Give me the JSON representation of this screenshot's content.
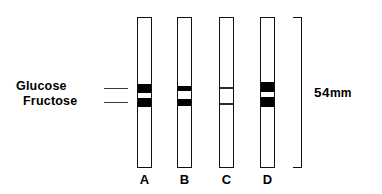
{
  "figure": {
    "type": "chromatography-strip-diagram",
    "analyte_labels": [
      {
        "name": "glucose",
        "text": "Glucose"
      },
      {
        "name": "fructose",
        "text": "Fructose"
      }
    ],
    "leaders": [
      {
        "name": "glucose-leader",
        "x": 104,
        "y": 88,
        "length": 24
      },
      {
        "name": "fructose-leader",
        "x": 104,
        "y": 102,
        "length": 24
      }
    ],
    "strips": [
      {
        "id": "A",
        "caption": "A",
        "x": 137,
        "bands": [
          {
            "analyte": "Glucose",
            "top": 66,
            "height": 9,
            "intensity": "strong"
          },
          {
            "analyte": "Fructose",
            "top": 80,
            "height": 9,
            "intensity": "strong"
          }
        ]
      },
      {
        "id": "B",
        "caption": "B",
        "x": 177,
        "bands": [
          {
            "analyte": "Glucose",
            "top": 68,
            "height": 5,
            "intensity": "strong"
          },
          {
            "analyte": "Fructose",
            "top": 81,
            "height": 7,
            "intensity": "strong"
          }
        ]
      },
      {
        "id": "C",
        "caption": "C",
        "x": 219,
        "bands": [
          {
            "analyte": "Glucose",
            "top": 69,
            "height": 2,
            "intensity": "faint"
          },
          {
            "analyte": "Fructose",
            "top": 85,
            "height": 2,
            "intensity": "faint"
          }
        ]
      },
      {
        "id": "D",
        "caption": "D",
        "x": 260,
        "bands": [
          {
            "analyte": "Glucose",
            "top": 64,
            "height": 10,
            "intensity": "strong"
          },
          {
            "analyte": "Fructose",
            "top": 79,
            "height": 10,
            "intensity": "strong"
          }
        ]
      }
    ],
    "measurement": {
      "name": "strip-length",
      "value": "54",
      "unit": "mm"
    }
  },
  "colors": {
    "ink": "#000000",
    "band_strong": "#000000",
    "band_faint": "#2b2b2b",
    "leader": "#3a3a3a",
    "background": "#ffffff"
  }
}
